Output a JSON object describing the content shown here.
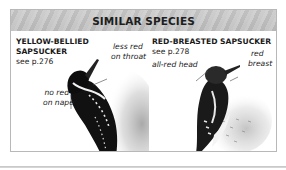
{
  "panel": {
    "title": "SIMILAR SPECIES",
    "header_color": "#c4c4c4",
    "border_color": "#b8b8b8"
  },
  "species": [
    {
      "name_line1": "YELLOW-BELLIED",
      "name_line2": "SAPSUCKER",
      "see_ref": "see p.276",
      "notes": [
        {
          "line1": "less red",
          "line2": "on throat"
        },
        {
          "line1": "no red",
          "line2": "on nape"
        }
      ],
      "illustration": "yellow-bellied-sapsucker-illustration"
    },
    {
      "name_line1": "RED-BREASTED SAPSUCKER",
      "see_ref": "see p.278",
      "notes": [
        {
          "line1": "all-red head"
        },
        {
          "line1": "red",
          "line2": "breast"
        }
      ],
      "illustration": "red-breasted-sapsucker-illustration"
    }
  ]
}
